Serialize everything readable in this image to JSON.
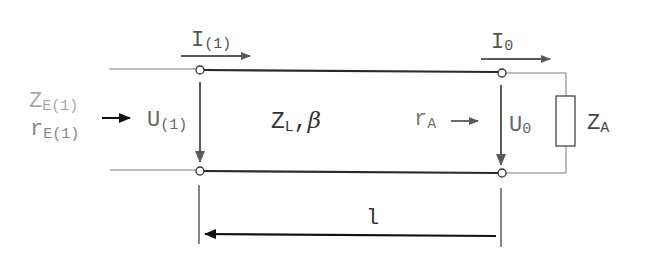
{
  "diagram": {
    "type": "transmission-line-circuit",
    "colors": {
      "line_thick": "#2a2a2a",
      "line_thin": "#7a7a7a",
      "arrow_gray": "#5a5a5a",
      "arrow_black": "#111111",
      "text_dark": "#333333",
      "text_light": "#a8a8a8",
      "text_mid": "#7a7a7a"
    },
    "labels": {
      "input_current": {
        "main": "I",
        "sub": "(1)"
      },
      "output_current": {
        "main": "I",
        "sub": "0"
      },
      "input_voltage": {
        "main": "U",
        "sub": "(1)"
      },
      "output_voltage": {
        "main": "U",
        "sub": "0"
      },
      "line_params": {
        "main": "Z",
        "sub": "L",
        "suffix": ",",
        "greek": "β"
      },
      "input_impedance": {
        "main": "Z",
        "sub": "E(1)"
      },
      "input_reflection": {
        "main": "r",
        "sub": "E(1)"
      },
      "load_reflection": {
        "main": "r",
        "sub": "A"
      },
      "load_impedance": {
        "main": "Z",
        "sub": "A"
      },
      "length": "l"
    }
  }
}
